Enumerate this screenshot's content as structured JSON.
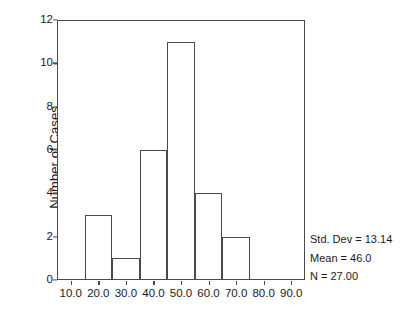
{
  "chart_data": {
    "type": "bar",
    "title": "",
    "subtitle": "",
    "xlabel": "",
    "ylabel": "Number of Cases",
    "xlim": [
      5,
      95
    ],
    "ylim": [
      0,
      12
    ],
    "grid": false,
    "legend": null,
    "bin_width": 10,
    "categories": [
      "15-25",
      "25-35",
      "35-45",
      "45-55",
      "55-65",
      "65-75"
    ],
    "bin_edges": [
      15,
      25,
      35,
      45,
      55,
      65,
      75
    ],
    "values": [
      3,
      1,
      6,
      11,
      4,
      2
    ],
    "bars": [
      {
        "start": 15,
        "end": 25,
        "count": 3
      },
      {
        "start": 25,
        "end": 35,
        "count": 1
      },
      {
        "start": 35,
        "end": 45,
        "count": 6
      },
      {
        "start": 45,
        "end": 55,
        "count": 11
      },
      {
        "start": 55,
        "end": 65,
        "count": 4
      },
      {
        "start": 65,
        "end": 75,
        "count": 2
      }
    ],
    "x_ticks": [
      10,
      20,
      30,
      40,
      50,
      60,
      70,
      80,
      90
    ],
    "x_tick_labels": [
      "10.0",
      "20.0",
      "30.0",
      "40.0",
      "50.0",
      "60.0",
      "70.0",
      "80.0",
      "90.0"
    ],
    "y_ticks": [
      0,
      2,
      4,
      6,
      8,
      10,
      12
    ],
    "y_tick_labels": [
      "0",
      "2",
      "4",
      "6",
      "8",
      "10",
      "12"
    ],
    "annotations": [
      "Std. Dev = 13.14",
      "Mean = 46.0",
      "N = 27.00"
    ]
  },
  "statistics": {
    "std_dev_label": "Std. Dev = 13.14",
    "mean_label": "Mean = 46.0",
    "n_label": "N = 27.00"
  },
  "colors": {
    "background": "#ffffff",
    "axis": "#4a4a4a",
    "bar_fill": "#ffffff",
    "bar_stroke": "#4a4a4a",
    "text": "#1a1a1a"
  }
}
